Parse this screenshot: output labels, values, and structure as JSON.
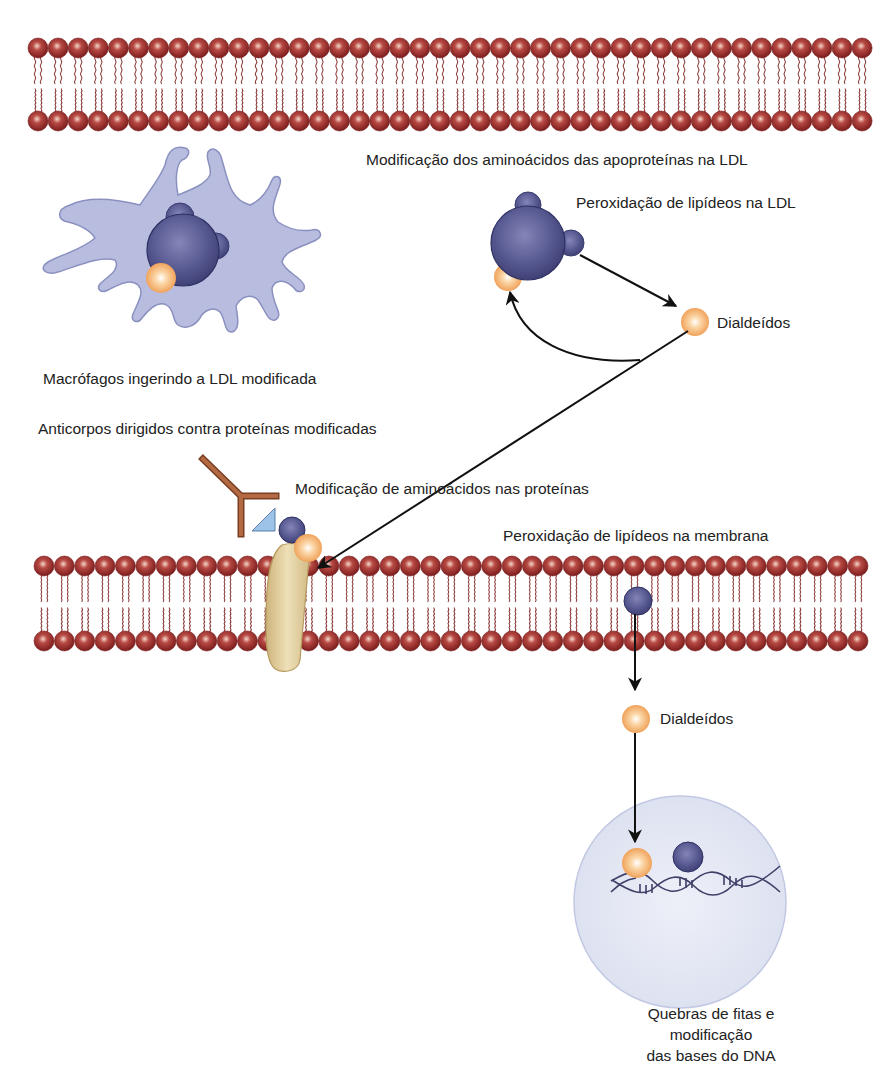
{
  "labels": {
    "apoprotein_mod": "Modificação dos aminoácidos das apoproteínas na LDL",
    "ldl_peroxidation": "Peroxidação de lipídeos na LDL",
    "dialdehydes_top": "Dialdeídos",
    "macrophage": "Macrófagos ingerindo a LDL modificada",
    "antibodies": "Anticorpos dirigidos contra proteínas modificadas",
    "protein_mod": "Modificação de aminoácidos nas proteínas",
    "membrane_peroxidation": "Peroxidação de lipídeos na membrana",
    "dialdehydes_bottom": "Dialdeídos",
    "dna_damage": "Quebras de fitas e modificação\ndas bases do DNA"
  },
  "colors": {
    "lipid_head": "#9b2a2a",
    "lipid_tail": "#8a3a3a",
    "ldl": "#4f4f8a",
    "dialdehyde": "#f0a860",
    "macrophage": "#b8bde0",
    "antibody": "#a8603a",
    "antigen": "#9ec3e8",
    "membrane_protein": "#e0cc98",
    "nucleus": "#e4e8f5",
    "arrow": "#111111"
  },
  "membranes": [
    {
      "name": "top-membrane",
      "x_start": 38,
      "x_end": 862,
      "top_heads_y": 48,
      "bottom_heads_y": 121,
      "spacing": 20.1
    },
    {
      "name": "cell-membrane",
      "x_start": 44,
      "x_end": 858,
      "top_heads_y": 566,
      "bottom_heads_y": 641,
      "spacing": 20.35
    }
  ]
}
